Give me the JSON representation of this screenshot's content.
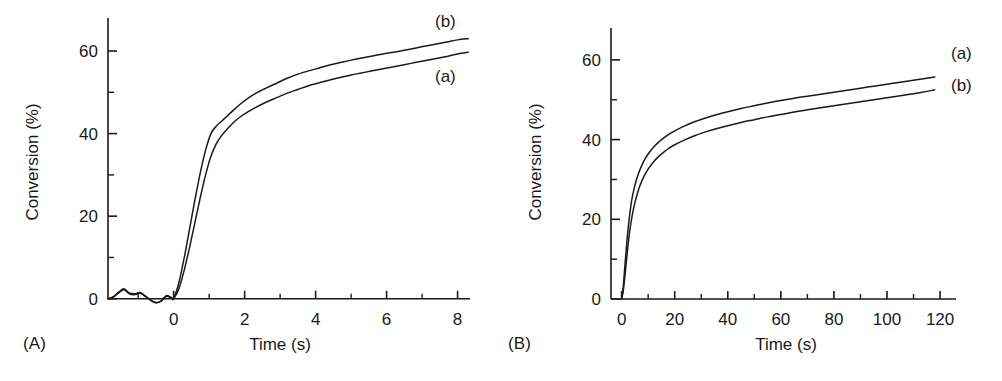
{
  "figure": {
    "background": "#ffffff",
    "ink": "#1a1a1a"
  },
  "panels": [
    {
      "tag": "(A)",
      "xlabel": "Time (s)",
      "ylabel": "Conversion (%)",
      "series_labels": {
        "upper": "(b)",
        "lower": "(a)"
      }
    },
    {
      "tag": "(B)",
      "xlabel": "Time (s)",
      "ylabel": "Conversion (%)",
      "series_labels": {
        "upper": "(a)",
        "lower": "(b)"
      }
    }
  ],
  "chart_data": [
    {
      "type": "line",
      "panel": "A",
      "title": "",
      "xlabel": "Time (s)",
      "ylabel": "Conversion (%)",
      "xlim": [
        -1.85,
        8.35
      ],
      "ylim": [
        -2.0,
        68.0
      ],
      "xticks": [
        0,
        2,
        4,
        6,
        8
      ],
      "xticklabels": [
        "0",
        "2",
        "4",
        "6",
        "8"
      ],
      "xminorticks": [
        -1,
        1,
        3,
        5,
        7
      ],
      "yticks": [
        0,
        20,
        40,
        60
      ],
      "yticklabels": [
        "0",
        "20",
        "40",
        "60"
      ],
      "yminorticks": [
        10,
        30,
        50
      ],
      "grid": false,
      "legend": "inline-right-annotations",
      "annotations": [
        {
          "text": "(b)",
          "x": 7.6,
          "y": 67.0
        },
        {
          "text": "(a)",
          "x": 7.6,
          "y": 56.0
        }
      ],
      "series": [
        {
          "name": "(b)",
          "position": "upper",
          "color": "#1a1a1a",
          "x": [
            -1.85,
            -1.7,
            -1.55,
            -1.4,
            -1.25,
            -1.1,
            -0.95,
            -0.8,
            -0.65,
            -0.5,
            -0.35,
            -0.2,
            -0.05,
            0.0,
            0.15,
            0.3,
            0.45,
            0.6,
            0.75,
            0.9,
            1.05,
            1.2,
            1.35,
            1.5,
            1.7,
            1.9,
            2.1,
            2.3,
            2.6,
            2.9,
            3.2,
            3.5,
            3.8,
            4.1,
            4.4,
            4.7,
            5.0,
            5.3,
            5.6,
            5.9,
            6.2,
            6.5,
            6.8,
            7.1,
            7.4,
            7.7,
            8.0,
            8.3
          ],
          "y": [
            0.0,
            0.5,
            1.6,
            2.4,
            1.4,
            1.2,
            1.5,
            0.7,
            -0.3,
            -0.9,
            -0.5,
            0.8,
            0.2,
            0.0,
            4.0,
            10.0,
            17.0,
            24.0,
            30.5,
            36.0,
            40.0,
            41.8,
            43.0,
            44.2,
            45.8,
            47.3,
            48.6,
            49.7,
            51.0,
            52.2,
            53.4,
            54.4,
            55.2,
            55.9,
            56.6,
            57.2,
            57.8,
            58.3,
            58.8,
            59.3,
            59.7,
            60.2,
            60.7,
            61.2,
            61.7,
            62.2,
            62.7,
            63.0
          ]
        },
        {
          "name": "(a)",
          "position": "lower",
          "color": "#1a1a1a",
          "x": [
            -1.85,
            -1.7,
            -1.55,
            -1.4,
            -1.25,
            -1.1,
            -0.95,
            -0.8,
            -0.65,
            -0.5,
            -0.35,
            -0.2,
            -0.05,
            0.0,
            0.15,
            0.3,
            0.45,
            0.6,
            0.75,
            0.9,
            1.05,
            1.2,
            1.35,
            1.5,
            1.7,
            1.9,
            2.1,
            2.3,
            2.6,
            2.9,
            3.2,
            3.5,
            3.8,
            4.1,
            4.4,
            4.7,
            5.0,
            5.3,
            5.6,
            5.9,
            6.2,
            6.5,
            6.8,
            7.1,
            7.4,
            7.7,
            8.0,
            8.3
          ],
          "y": [
            0.0,
            0.4,
            1.4,
            2.2,
            1.2,
            1.0,
            1.3,
            0.6,
            -0.4,
            -1.0,
            -0.6,
            0.6,
            0.1,
            0.0,
            2.5,
            7.0,
            12.5,
            18.5,
            24.5,
            30.0,
            34.5,
            37.5,
            39.5,
            41.0,
            42.8,
            44.2,
            45.3,
            46.3,
            47.6,
            48.7,
            49.8,
            50.7,
            51.6,
            52.3,
            53.0,
            53.6,
            54.2,
            54.7,
            55.2,
            55.7,
            56.2,
            56.7,
            57.2,
            57.7,
            58.2,
            58.7,
            59.3,
            59.7
          ]
        }
      ]
    },
    {
      "type": "line",
      "panel": "B",
      "title": "",
      "xlabel": "Time (s)",
      "ylabel": "Conversion (%)",
      "xlim": [
        -4.0,
        126.0
      ],
      "ylim": [
        -2.0,
        68.0
      ],
      "xticks": [
        0,
        20,
        40,
        60,
        80,
        100,
        120
      ],
      "xticklabels": [
        "0",
        "20",
        "40",
        "60",
        "80",
        "100",
        "120"
      ],
      "xminorticks": [
        10,
        30,
        50,
        70,
        90,
        110
      ],
      "yticks": [
        0,
        20,
        40,
        60
      ],
      "yticklabels": [
        "0",
        "20",
        "40",
        "60"
      ],
      "yminorticks": [
        10,
        30,
        50
      ],
      "grid": false,
      "legend": "inline-right-annotations",
      "annotations": [
        {
          "text": "(a)",
          "x": 122.0,
          "y": 56.5
        },
        {
          "text": "(b)",
          "x": 122.0,
          "y": 50.0
        }
      ],
      "series": [
        {
          "name": "(a)",
          "position": "upper",
          "color": "#1a1a1a",
          "x": [
            0.0,
            0.6,
            1.2,
            1.8,
            2.5,
            3.2,
            4.0,
            5.0,
            6.0,
            7.0,
            8.5,
            10.0,
            12.0,
            14.0,
            16.0,
            18.0,
            20.0,
            24.0,
            28.0,
            32.0,
            36.0,
            40.0,
            45.0,
            50.0,
            55.0,
            60.0,
            65.0,
            70.0,
            75.0,
            80.0,
            85.0,
            90.0,
            95.0,
            100.0,
            105.0,
            110.0,
            115.0,
            118.0
          ],
          "y": [
            0.0,
            3.0,
            8.0,
            13.0,
            18.0,
            22.0,
            25.5,
            28.5,
            30.8,
            32.6,
            34.8,
            36.4,
            38.1,
            39.4,
            40.5,
            41.4,
            42.2,
            43.5,
            44.6,
            45.5,
            46.3,
            47.0,
            47.8,
            48.5,
            49.2,
            49.8,
            50.4,
            50.9,
            51.4,
            51.9,
            52.4,
            52.9,
            53.4,
            53.9,
            54.4,
            54.9,
            55.4,
            55.7
          ]
        },
        {
          "name": "(b)",
          "position": "lower",
          "color": "#1a1a1a",
          "x": [
            0.0,
            0.6,
            1.2,
            1.8,
            2.5,
            3.2,
            4.0,
            5.0,
            6.0,
            7.0,
            8.5,
            10.0,
            12.0,
            14.0,
            16.0,
            18.0,
            20.0,
            24.0,
            28.0,
            32.0,
            36.0,
            40.0,
            45.0,
            50.0,
            55.0,
            60.0,
            65.0,
            70.0,
            75.0,
            80.0,
            85.0,
            90.0,
            95.0,
            100.0,
            105.0,
            110.0,
            115.0,
            118.0
          ],
          "y": [
            0.0,
            2.0,
            5.5,
            9.5,
            14.0,
            17.8,
            21.0,
            24.2,
            26.6,
            28.6,
            30.9,
            32.6,
            34.4,
            35.8,
            36.9,
            37.9,
            38.7,
            40.0,
            41.1,
            42.0,
            42.8,
            43.5,
            44.3,
            45.0,
            45.7,
            46.3,
            46.9,
            47.5,
            48.0,
            48.5,
            49.0,
            49.5,
            50.0,
            50.5,
            51.0,
            51.5,
            52.1,
            52.5
          ]
        }
      ]
    }
  ]
}
